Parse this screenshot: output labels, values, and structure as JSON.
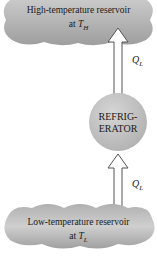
{
  "diagram": {
    "type": "refrigerator-schematic",
    "top_reservoir": {
      "line1": "High-temperature reservoir",
      "line2_prefix": "at ",
      "temp_symbol": "T",
      "temp_sub": "H"
    },
    "bottom_reservoir": {
      "line1": "Low-temperature reservoir",
      "line2_prefix": "at ",
      "temp_symbol": "T",
      "temp_sub": "L"
    },
    "device": {
      "line1": "REFRIG-",
      "line2": "ERATOR"
    },
    "upper_arrow": {
      "symbol": "Q",
      "sub": "L",
      "direction": "up"
    },
    "lower_arrow": {
      "symbol": "Q",
      "sub": "L",
      "direction": "up"
    },
    "colors": {
      "cloud": "#b5b5b5",
      "device": "#bdbdbd",
      "arrow_stroke": "#555555"
    }
  }
}
